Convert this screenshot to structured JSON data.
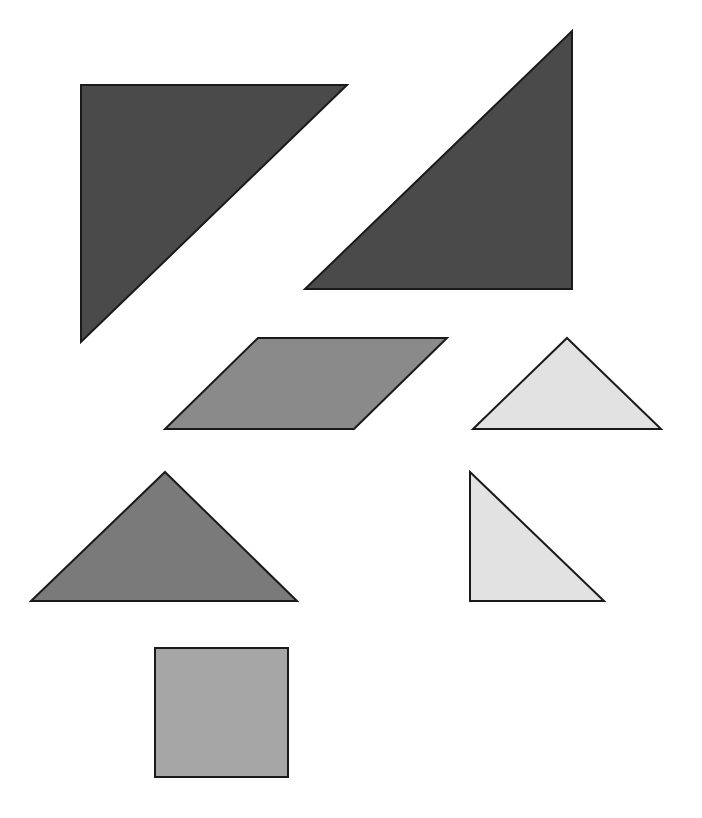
{
  "diagram": {
    "type": "tangram-pieces",
    "width": 702,
    "height": 818,
    "background": "#ffffff",
    "stroke_color": "#1a1a1a",
    "stroke_width": 2,
    "pieces": [
      {
        "id": "large-triangle-1",
        "kind": "large-triangle",
        "fill": "#4a4a4a",
        "points": [
          [
            81,
            85
          ],
          [
            347,
            85
          ],
          [
            81,
            342
          ]
        ]
      },
      {
        "id": "large-triangle-2",
        "kind": "large-triangle",
        "fill": "#4a4a4a",
        "points": [
          [
            572,
            31
          ],
          [
            572,
            289
          ],
          [
            305,
            289
          ]
        ]
      },
      {
        "id": "parallelogram",
        "kind": "parallelogram",
        "fill": "#8a8a8a",
        "points": [
          [
            258,
            338
          ],
          [
            447,
            338
          ],
          [
            354,
            429
          ],
          [
            165,
            429
          ]
        ]
      },
      {
        "id": "small-triangle-1",
        "kind": "small-triangle",
        "fill": "#e2e2e2",
        "points": [
          [
            567,
            338
          ],
          [
            661,
            429
          ],
          [
            473,
            429
          ]
        ]
      },
      {
        "id": "medium-triangle",
        "kind": "medium-triangle",
        "fill": "#7a7a7a",
        "points": [
          [
            165,
            472
          ],
          [
            297,
            601
          ],
          [
            31,
            601
          ]
        ]
      },
      {
        "id": "small-triangle-2",
        "kind": "small-triangle",
        "fill": "#e2e2e2",
        "points": [
          [
            470,
            472
          ],
          [
            604,
            601
          ],
          [
            470,
            601
          ]
        ]
      },
      {
        "id": "square",
        "kind": "square",
        "fill": "#a6a6a6",
        "points": [
          [
            155,
            648
          ],
          [
            288,
            648
          ],
          [
            288,
            777
          ],
          [
            155,
            777
          ]
        ]
      }
    ]
  }
}
